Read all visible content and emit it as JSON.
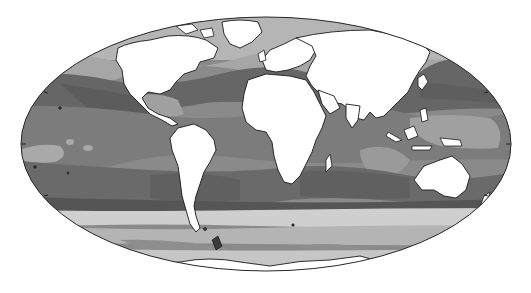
{
  "map": {
    "projection": "mollweide",
    "style": "grayscale",
    "ocean_field_levels": [
      {
        "name": "level-1",
        "color": "#5f5f5f"
      },
      {
        "name": "level-2",
        "color": "#747474"
      },
      {
        "name": "level-3",
        "color": "#8a8a8a"
      },
      {
        "name": "level-4",
        "color": "#a3a3a3"
      },
      {
        "name": "level-5",
        "color": "#bdbdbd"
      },
      {
        "name": "level-6",
        "color": "#d6d6d6"
      }
    ],
    "land_color": "#ffffff",
    "coastline_color": "#1a1a1a",
    "continents": [
      "North America",
      "South America",
      "Europe",
      "Asia",
      "Africa",
      "Australia",
      "Antarctica",
      "Greenland"
    ],
    "oceans": [
      "Pacific Ocean",
      "Atlantic Ocean",
      "Indian Ocean",
      "Southern Ocean",
      "Arctic Ocean"
    ]
  }
}
